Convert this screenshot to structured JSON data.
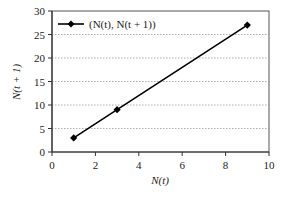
{
  "chart_data": {
    "type": "line",
    "title": "",
    "xlabel": "N(t)",
    "ylabel": "N(t + 1)",
    "xlim": [
      0,
      10
    ],
    "ylim": [
      0,
      30
    ],
    "xticks": [
      0,
      2,
      4,
      6,
      8,
      10
    ],
    "yticks": [
      0,
      5,
      10,
      15,
      20,
      25,
      30
    ],
    "grid": "horizontal dotted",
    "legend_position": "upper left inside",
    "series": [
      {
        "name": "(N(t), N(t + 1))",
        "marker": "diamond",
        "color": "#000000",
        "x": [
          1,
          3,
          9
        ],
        "y": [
          3,
          9,
          27
        ]
      }
    ]
  }
}
